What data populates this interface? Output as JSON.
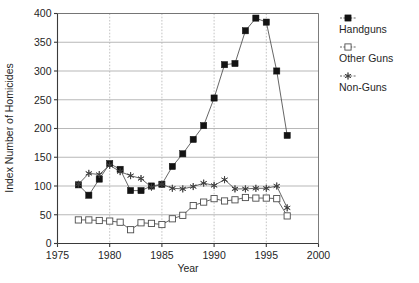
{
  "chart_data": {
    "type": "line",
    "title": "",
    "xlabel": "Year",
    "ylabel": "Index Number of Homicides",
    "xlim": [
      1975,
      2000
    ],
    "ylim": [
      0,
      400
    ],
    "xticks": [
      1975,
      1980,
      1985,
      1990,
      1995,
      2000
    ],
    "yticks": [
      0,
      50,
      100,
      150,
      200,
      250,
      300,
      350,
      400
    ],
    "grid": true,
    "legend_position": "right",
    "x": [
      1977,
      1978,
      1979,
      1980,
      1981,
      1982,
      1983,
      1984,
      1985,
      1986,
      1987,
      1988,
      1989,
      1990,
      1991,
      1992,
      1993,
      1994,
      1995,
      1996,
      1997
    ],
    "series": [
      {
        "name": "Handguns",
        "marker": "filled-square",
        "values": [
          102,
          84,
          112,
          139,
          129,
          92,
          92,
          100,
          103,
          134,
          156,
          181,
          205,
          253,
          311,
          313,
          370,
          392,
          385,
          300,
          188
        ]
      },
      {
        "name": "Other Guns",
        "marker": "open-square",
        "values": [
          41,
          41,
          40,
          39,
          37,
          24,
          36,
          35,
          33,
          43,
          49,
          66,
          72,
          78,
          74,
          76,
          80,
          79,
          79,
          78,
          48
        ]
      },
      {
        "name": "Non-Guns",
        "marker": "asterisk",
        "values": [
          103,
          122,
          120,
          136,
          125,
          118,
          113,
          98,
          103,
          96,
          95,
          99,
          105,
          101,
          111,
          95,
          95,
          96,
          96,
          100,
          62
        ]
      }
    ]
  },
  "legend": {
    "items": [
      {
        "label": "Handguns",
        "marker": "filled-square"
      },
      {
        "label": "Other Guns",
        "marker": "open-square"
      },
      {
        "label": "Non-Guns",
        "marker": "asterisk"
      }
    ]
  },
  "axes": {
    "x_title": "Year",
    "y_title": "Index Number of Homicides",
    "x_tick_labels": [
      "1975",
      "1980",
      "1985",
      "1990",
      "1995",
      "2000"
    ],
    "y_tick_labels": [
      "0",
      "50",
      "100",
      "150",
      "200",
      "250",
      "300",
      "350",
      "400"
    ]
  },
  "colors": {
    "axis": "#3a3a3a",
    "grid": "#aaaaaa",
    "line": "#4a4a4a",
    "handguns": "#131313",
    "other_guns": "#ffffff",
    "non_guns": "#3d3d3d",
    "background": "#ffffff"
  }
}
